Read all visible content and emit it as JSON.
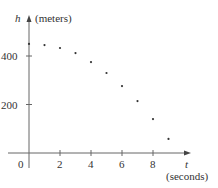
{
  "chart_data": {
    "type": "scatter",
    "title": "",
    "xlabel": "t",
    "xlabel_unit": "(seconds)",
    "ylabel": "h",
    "ylabel_unit": "(meters)",
    "x": [
      0,
      1,
      2,
      3,
      4,
      5,
      6,
      7,
      8,
      9
    ],
    "series": [
      {
        "name": "height",
        "values": [
          450,
          445,
          433,
          412,
          375,
          330,
          276,
          214,
          140,
          58
        ]
      }
    ],
    "x_ticks": [
      "0",
      "2",
      "4",
      "6",
      "8"
    ],
    "y_ticks": [
      "200",
      "400"
    ],
    "xlim": [
      0,
      10
    ],
    "ylim": [
      0,
      500
    ],
    "grid": false,
    "legend": "none",
    "colors": {
      "axis": "#555555",
      "point": "#333333",
      "text": "#333333"
    }
  },
  "labels": {
    "origin": "0",
    "x_ticks": [
      "2",
      "4",
      "6",
      "8"
    ],
    "y_ticks": [
      "200",
      "400"
    ],
    "x_axis_var": "t",
    "x_axis_unit": "(seconds)",
    "y_axis_var": "h",
    "y_axis_unit": "(meters)"
  }
}
